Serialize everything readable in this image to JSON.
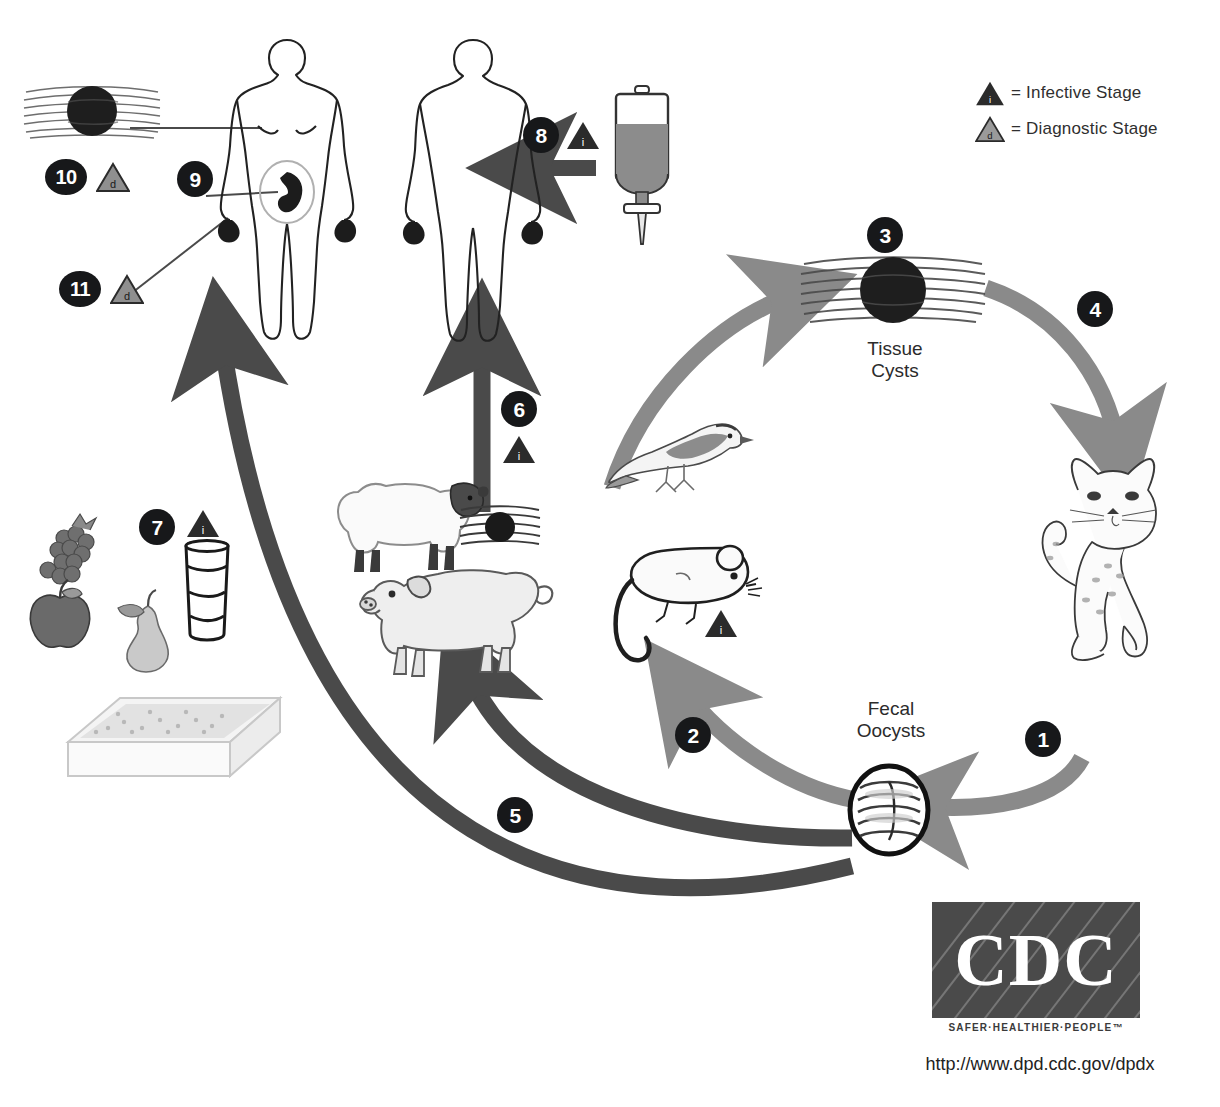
{
  "diagram": {
    "background": "#ffffff",
    "ink": "#1a1a1a",
    "cycle_arrow_color": "#8a8a8a",
    "transmission_arrow_color": "#4a4a4a"
  },
  "legend": {
    "items": [
      {
        "icon": "infective-stage-triangle",
        "symbol": "i",
        "text": "= Infective Stage"
      },
      {
        "icon": "diagnostic-stage-triangle",
        "symbol": "d",
        "text": "= Diagnostic Stage"
      }
    ]
  },
  "labels": {
    "tissue_cysts": "Tissue\nCysts",
    "fecal_oocysts": "Fecal\nOocysts"
  },
  "steps": [
    {
      "number": "1",
      "stage": null,
      "description": "Cat sheds unsporulated oocysts in feces"
    },
    {
      "number": "2",
      "stage": null,
      "description": "Oocysts ingested by rodents and birds"
    },
    {
      "number": "3",
      "stage": null,
      "description": "Tissue cysts form in intermediate host tissue"
    },
    {
      "number": "4",
      "stage": null,
      "description": "Cat ingests tissue cysts in infected prey"
    },
    {
      "number": "5",
      "stage": null,
      "description": "Oocysts ingested by food animals (pig)"
    },
    {
      "number": "6",
      "stage": "i",
      "description": "Human eats undercooked meat with tissue cysts"
    },
    {
      "number": "7",
      "stage": "i",
      "description": "Human ingests oocysts from food, water or litter"
    },
    {
      "number": "8",
      "stage": "i",
      "description": "Blood transfusion or organ transplantation"
    },
    {
      "number": "9",
      "stage": null,
      "description": "Transplacental transmission to fetus"
    },
    {
      "number": "10",
      "stage": "d",
      "description": "Tissue cysts in human tissue (biopsy)"
    },
    {
      "number": "11",
      "stage": "d",
      "description": "Blood sample for diagnosis"
    }
  ],
  "organisms": [
    {
      "name": "cat",
      "role": "definitive host"
    },
    {
      "name": "bird",
      "role": "intermediate host"
    },
    {
      "name": "mouse",
      "role": "intermediate host"
    },
    {
      "name": "sheep",
      "role": "food animal"
    },
    {
      "name": "pig",
      "role": "food animal"
    },
    {
      "name": "human-female-pregnant",
      "role": "incidental host"
    },
    {
      "name": "human-male",
      "role": "incidental host"
    }
  ],
  "objects": [
    {
      "name": "blood-transfusion-bag"
    },
    {
      "name": "fruit-berries"
    },
    {
      "name": "fruit-apple"
    },
    {
      "name": "fruit-pear"
    },
    {
      "name": "water-glass"
    },
    {
      "name": "cat-litter-box"
    },
    {
      "name": "tissue-cyst-meat"
    }
  ],
  "cdc": {
    "logo_text": "CDC",
    "tagline": "SAFER·HEALTHIER·PEOPLE™",
    "url": "http://www.dpd.cdc.gov/dpdx"
  }
}
